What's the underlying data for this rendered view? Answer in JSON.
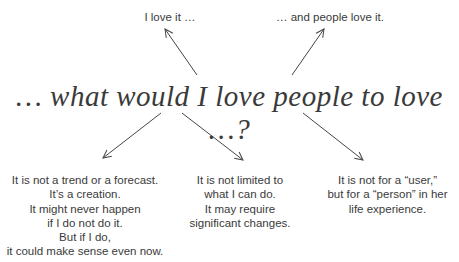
{
  "diagram": {
    "central_question": "… what would I love people to love …?",
    "top_left": "I love it …",
    "top_right": "… and people love it.",
    "bottom_left": [
      "It is not a trend or a forecast.",
      "It’s a creation.",
      "It might never happen",
      "if I do not do it.",
      "But if I do,",
      "it could make sense even now."
    ],
    "bottom_middle": [
      "It is not limited to",
      "what I can do.",
      "It may require",
      "significant changes."
    ],
    "bottom_right": [
      "It is not for a “user,”",
      "but for a “person” in her",
      "life experience."
    ],
    "arrows": [
      {
        "from": "central",
        "to": "top_left"
      },
      {
        "from": "central",
        "to": "top_right"
      },
      {
        "from": "central",
        "to": "bottom_left"
      },
      {
        "from": "central",
        "to": "bottom_middle"
      },
      {
        "from": "central",
        "to": "bottom_right"
      }
    ],
    "colors": {
      "text": "#3a3a3a",
      "arrow": "#444444",
      "background": "#ffffff"
    }
  }
}
